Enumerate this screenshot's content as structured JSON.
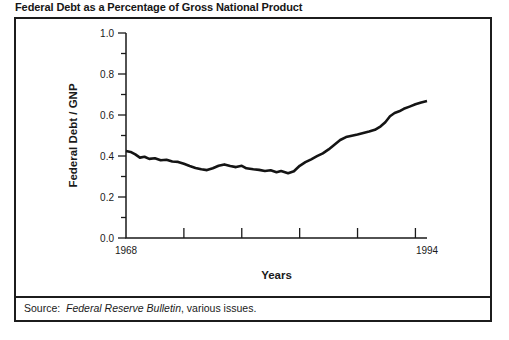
{
  "source": {
    "label": "Source:  ",
    "publication": "Federal Reserve Bulletin",
    "suffix": ", various issues."
  },
  "chart_data": {
    "type": "line",
    "title": "Federal Debt as a Percentage of Gross National Product",
    "xlabel": "Years",
    "ylabel": "Federal Debt / GNP",
    "xlim": [
      1968,
      1994
    ],
    "ylim": [
      0.0,
      1.0
    ],
    "x_end_tick_labels": [
      "1968",
      "1994"
    ],
    "x_tick_years": [
      1973,
      1978,
      1983,
      1988,
      1993
    ],
    "y_major_ticks": [
      0.0,
      0.2,
      0.4,
      0.6,
      0.8,
      1.0
    ],
    "y_minor_step": 0.1,
    "grid": false,
    "legend": "none",
    "colors": {
      "line": "#141414",
      "axis": "#1a1a1a",
      "text": "#1a1a1a"
    },
    "series": [
      {
        "name": "Federal Debt / GNP",
        "points": [
          [
            1968.0,
            0.425
          ],
          [
            1968.4,
            0.42
          ],
          [
            1968.8,
            0.408
          ],
          [
            1969.2,
            0.392
          ],
          [
            1969.6,
            0.396
          ],
          [
            1970.0,
            0.386
          ],
          [
            1970.5,
            0.389
          ],
          [
            1971.0,
            0.379
          ],
          [
            1971.5,
            0.382
          ],
          [
            1972.0,
            0.373
          ],
          [
            1972.5,
            0.371
          ],
          [
            1973.0,
            0.362
          ],
          [
            1973.5,
            0.351
          ],
          [
            1974.0,
            0.342
          ],
          [
            1974.5,
            0.335
          ],
          [
            1975.0,
            0.331
          ],
          [
            1975.5,
            0.34
          ],
          [
            1976.0,
            0.352
          ],
          [
            1976.5,
            0.359
          ],
          [
            1977.0,
            0.351
          ],
          [
            1977.5,
            0.346
          ],
          [
            1978.0,
            0.352
          ],
          [
            1978.4,
            0.34
          ],
          [
            1979.0,
            0.335
          ],
          [
            1979.5,
            0.332
          ],
          [
            1980.0,
            0.327
          ],
          [
            1980.5,
            0.33
          ],
          [
            1981.0,
            0.321
          ],
          [
            1981.4,
            0.327
          ],
          [
            1982.0,
            0.316
          ],
          [
            1982.5,
            0.326
          ],
          [
            1983.0,
            0.352
          ],
          [
            1983.5,
            0.37
          ],
          [
            1984.0,
            0.384
          ],
          [
            1984.5,
            0.399
          ],
          [
            1985.0,
            0.413
          ],
          [
            1985.5,
            0.432
          ],
          [
            1986.0,
            0.455
          ],
          [
            1986.5,
            0.478
          ],
          [
            1987.0,
            0.492
          ],
          [
            1987.5,
            0.499
          ],
          [
            1988.0,
            0.505
          ],
          [
            1988.5,
            0.512
          ],
          [
            1989.0,
            0.519
          ],
          [
            1989.5,
            0.528
          ],
          [
            1990.0,
            0.545
          ],
          [
            1990.4,
            0.565
          ],
          [
            1990.8,
            0.594
          ],
          [
            1991.2,
            0.61
          ],
          [
            1991.6,
            0.618
          ],
          [
            1992.0,
            0.63
          ],
          [
            1992.5,
            0.641
          ],
          [
            1993.0,
            0.652
          ],
          [
            1993.5,
            0.661
          ],
          [
            1994.0,
            0.668
          ]
        ]
      }
    ]
  }
}
